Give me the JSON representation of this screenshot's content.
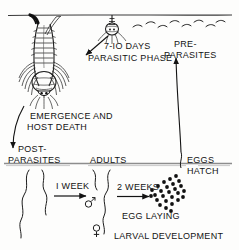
{
  "figure": {
    "background_color": "#fdfdfc",
    "ink_color": "#131313"
  },
  "labels": {
    "duration_parasitic": "7-IO DAYS",
    "phase_parasitic": "PARASITIC PHASE",
    "preparasites_line1": "PRE-",
    "preparasites_line2": "PARASITES",
    "emergence_line1": "EMERGENCE AND",
    "emergence_line2": "HOST DEATH",
    "postparasites_line1": "POST-",
    "postparasites_line2": "PARASITES",
    "adults": "ADULTS",
    "eggs_line1": "EGGS",
    "eggs_line2": "HATCH",
    "one_week": "I WEEK",
    "two_weeks": "2 WEEKS",
    "egg_laying": "EGG LAYING",
    "larval_development": "LARVAL DEVELOPMENT",
    "male_symbol": "♂",
    "female_symbol": "♀"
  },
  "stages": [
    {
      "id": "parasitic-phase",
      "label": "PARASITIC PHASE",
      "duration": "7-IO DAYS",
      "zone": "on-host"
    },
    {
      "id": "emergence",
      "label": "EMERGENCE AND HOST DEATH",
      "duration": "",
      "zone": "transition"
    },
    {
      "id": "post-parasites",
      "label": "POST-PARASITES",
      "duration": "",
      "zone": "soil"
    },
    {
      "id": "adults",
      "label": "ADULTS",
      "duration": "I WEEK",
      "zone": "soil"
    },
    {
      "id": "egg-laying",
      "label": "EGG LAYING",
      "duration": "2 WEEKS",
      "zone": "soil"
    },
    {
      "id": "eggs-hatch",
      "label": "EGGS HATCH",
      "duration": "",
      "zone": "soil"
    },
    {
      "id": "pre-parasites",
      "label": "PRE-PARASITES",
      "duration": "",
      "zone": "above-ground"
    }
  ],
  "counts": {
    "preparasite_squiggles": 8,
    "egg_dots": 26,
    "postparasite_worms": 2,
    "adult_worms": 2
  }
}
